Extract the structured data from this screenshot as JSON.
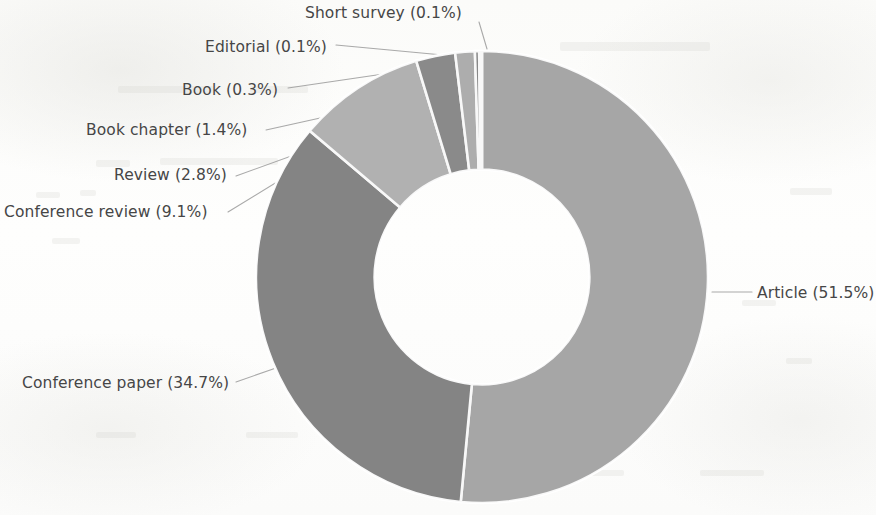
{
  "chart_data": {
    "type": "pie",
    "variant": "donut",
    "title": "",
    "subtitle": "",
    "xlabel": "",
    "ylabel": "",
    "legend_position": "none",
    "grid": false,
    "units": "percent",
    "labels_show_percent": true,
    "start_angle_deg": 0,
    "direction": "clockwise",
    "inner_radius_ratio": 0.475,
    "categories": [
      "Article",
      "Conference paper",
      "Conference review",
      "Review",
      "Book chapter",
      "Book",
      "Editorial",
      "Short survey"
    ],
    "values": [
      51.5,
      34.7,
      9.1,
      2.8,
      1.4,
      0.3,
      0.1,
      0.1
    ],
    "slice_colors": [
      "#a9a9a9",
      "#858585",
      "#b5b5b5",
      "#8c8c8c",
      "#b0b0b0",
      "#8a8a8a",
      "#8a8a8a",
      "#bdbdbd"
    ],
    "slices": [
      {
        "label": "Article (51.5%)",
        "name": "Article",
        "value": 51.5,
        "color": "#a9a9a9"
      },
      {
        "label": "Conference paper (34.7%)",
        "name": "Conference paper",
        "value": 34.7,
        "color": "#858585"
      },
      {
        "label": "Conference review (9.1%)",
        "name": "Conference review",
        "value": 9.1,
        "color": "#b5b5b5"
      },
      {
        "label": "Review (2.8%)",
        "name": "Review",
        "value": 2.8,
        "color": "#8c8c8c"
      },
      {
        "label": "Book chapter (1.4%)",
        "name": "Book chapter",
        "value": 1.4,
        "color": "#b0b0b0"
      },
      {
        "label": "Book (0.3%)",
        "name": "Book",
        "value": 0.3,
        "color": "#8a8a8a"
      },
      {
        "label": "Editorial (0.1%)",
        "name": "Editorial",
        "value": 0.1,
        "color": "#8a8a8a"
      },
      {
        "label": "Short survey (0.1%)",
        "name": "Short survey",
        "value": 0.1,
        "color": "#bdbdbd"
      }
    ]
  },
  "labels": {
    "article": "Article (51.5%)",
    "conference_paper": "Conference paper (34.7%)",
    "conference_review": "Conference  review (9.1%)",
    "review": "Review (2.8%)",
    "book_chapter": "Book  chapter (1.4%)",
    "book": "Book (0.3%)",
    "editorial": "Editorial (0.1%)",
    "short_survey": "Short  survey (0.1%)"
  },
  "style": {
    "background": "#fdfdfc",
    "label_color": "#464646",
    "leader_line_color": "#9a9a9a",
    "slice_gap_color": "#ffffff"
  }
}
